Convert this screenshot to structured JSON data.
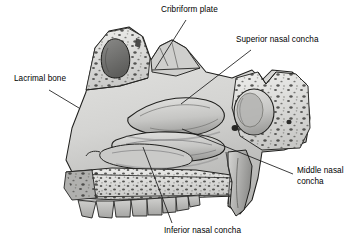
{
  "figure": {
    "view": "midsagittal cutaway of the skull showing the nasal cavity",
    "background_color": "#ffffff",
    "line_color": "#1a1a1a",
    "bone_fill": "#d8d8d6",
    "bone_shadow": "#9a9a98",
    "cavity_dark": "#6f6f6d",
    "tooth_fill": "#bdbdbb"
  },
  "labels": [
    {
      "id": "cribriform-plate",
      "text": "Cribriform plate",
      "x": 161,
      "y": 8,
      "leader": {
        "x1": 186,
        "y1": 20,
        "x2": 155,
        "y2": 69
      }
    },
    {
      "id": "superior-nasal-concha",
      "text": "Superior nasal concha",
      "x": 236,
      "y": 38,
      "leader": {
        "x1": 251,
        "y1": 50,
        "x2": 181,
        "y2": 104
      }
    },
    {
      "id": "lacrimal-bone",
      "text": "Lacrimal bone",
      "x": 14,
      "y": 77,
      "leader": {
        "x1": 49,
        "y1": 90,
        "x2": 79,
        "y2": 108
      }
    },
    {
      "id": "middle-nasal-concha",
      "text": "Middle nasal",
      "text2": "concha",
      "x": 297,
      "y": 169,
      "leader": {
        "x1": 293,
        "y1": 174,
        "x2": 182,
        "y2": 129
      }
    },
    {
      "id": "inferior-nasal-concha",
      "text": "Inferior nasal concha",
      "x": 164,
      "y": 228,
      "leader": {
        "x1": 172,
        "y1": 223,
        "x2": 143,
        "y2": 147
      }
    }
  ],
  "structures": [
    {
      "id": "frontal-sinus",
      "name": "frontal sinus cavity"
    },
    {
      "id": "nasal-bone-region",
      "name": "nasal bone region"
    },
    {
      "id": "ethmoid-region",
      "name": "ethmoid / cribriform region"
    },
    {
      "id": "sphenoid-sinus",
      "name": "sphenoid sinus"
    },
    {
      "id": "superior-concha-scroll",
      "name": "superior nasal concha"
    },
    {
      "id": "middle-concha-scroll",
      "name": "middle nasal concha"
    },
    {
      "id": "inferior-concha-scroll",
      "name": "inferior nasal concha"
    },
    {
      "id": "hard-palate",
      "name": "hard palate"
    },
    {
      "id": "maxillary-teeth",
      "name": "maxillary teeth row"
    },
    {
      "id": "pterygoid-plate",
      "name": "pterygoid plate"
    }
  ]
}
